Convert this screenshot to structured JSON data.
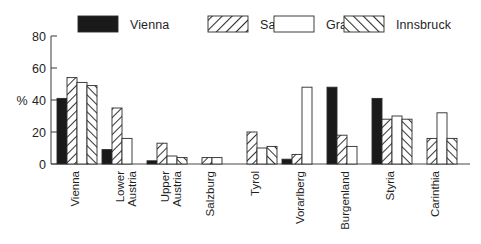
{
  "chart_data": {
    "type": "bar",
    "title": "",
    "xlabel": "",
    "ylabel": "%",
    "ylim": [
      0,
      80
    ],
    "yticks": [
      0,
      20,
      40,
      60,
      80
    ],
    "grid": false,
    "legend_position": "top",
    "categories": [
      "Vienna",
      "Lower Austria",
      "Upper Austria",
      "Salzburg",
      "Tyrol",
      "Vorarlberg",
      "Burgenland",
      "Styria",
      "Carinthia"
    ],
    "series": [
      {
        "name": "Vienna",
        "fill": "solid-black",
        "color": "#1a1a1a",
        "values": [
          41,
          9,
          2,
          0,
          0,
          3,
          48,
          41,
          0
        ]
      },
      {
        "name": "Salzburg",
        "fill": "hatch-forward",
        "color": "#ffffff",
        "values": [
          54,
          35,
          13,
          4,
          20,
          6,
          18,
          28,
          16
        ]
      },
      {
        "name": "Graz",
        "fill": "empty-white",
        "color": "#ffffff",
        "values": [
          51,
          16,
          5,
          4,
          10,
          48,
          11,
          30,
          32
        ]
      },
      {
        "name": "Innsbruck",
        "fill": "hatch-backward",
        "color": "#ffffff",
        "values": [
          49,
          0,
          4,
          0,
          11,
          0,
          0,
          28,
          16
        ]
      }
    ]
  },
  "legend": {
    "entries": [
      {
        "label": "Vienna",
        "swatch": "solid-black-swatch"
      },
      {
        "label": "Salzburg",
        "swatch": "forward-hatch-swatch"
      },
      {
        "label": "Graz",
        "swatch": "white-swatch"
      },
      {
        "label": "Innsbruck",
        "swatch": "backward-hatch-swatch"
      }
    ]
  },
  "axis": {
    "y_title": "%",
    "y_tick_0": "0",
    "y_tick_1": "20",
    "y_tick_2": "40",
    "y_tick_3": "60",
    "y_tick_4": "80"
  },
  "category_labels": {
    "c0": "Vienna",
    "c1_line1": "Lower",
    "c1_line2": "Austria",
    "c2_line1": "Upper",
    "c2_line2": "Austria",
    "c3": "Salzburg",
    "c4": "Tyrol",
    "c5": "Vorarlberg",
    "c6": "Burgenland",
    "c7": "Styria",
    "c8": "Carinthia"
  },
  "colors": {
    "bar_stroke": "#2b2b2b",
    "solid_fill": "#1a1a1a",
    "axis": "#4a4a4a",
    "background": "#ffffff",
    "text": "#1f1f1f"
  }
}
